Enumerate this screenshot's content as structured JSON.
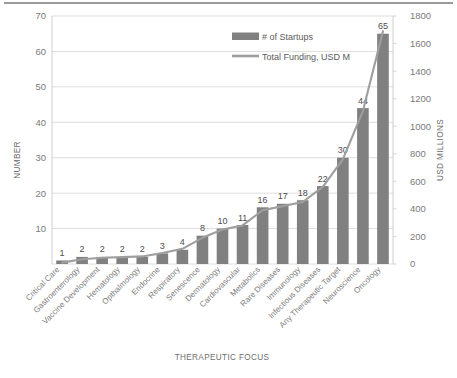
{
  "chart_data": {
    "type": "bar",
    "title": "",
    "xlabel": "THERAPEUTIC FOCUS",
    "ylabel": "NUMBER",
    "y2label": "USD MILLIONS",
    "ylim": [
      0,
      70
    ],
    "y2lim": [
      0,
      1800
    ],
    "yticks": [
      0,
      10,
      20,
      30,
      40,
      50,
      60,
      70
    ],
    "y2ticks": [
      0,
      200,
      400,
      600,
      800,
      1000,
      1200,
      1400,
      1600,
      1800
    ],
    "grid": true,
    "legend_position": "top-right",
    "categories": [
      "Critical Care",
      "Gastroenterology",
      "Vaccine Development",
      "Hematology",
      "Opthalmology",
      "Endocrine",
      "Respiratory",
      "Senescence",
      "Dermatology",
      "Cardiovascular",
      "Metabolics",
      "Rare Diseases",
      "Immunology",
      "Infectious Diseases",
      "Any Therapeutic Target",
      "Neuroscience",
      "Oncology"
    ],
    "series": [
      {
        "name": "# of Startups",
        "type": "bar",
        "axis": "left",
        "color": "#808080",
        "values": [
          1,
          2,
          2,
          2,
          2,
          3,
          4,
          8,
          10,
          11,
          16,
          17,
          18,
          22,
          30,
          44,
          65
        ],
        "data_labels": [
          "1",
          "2",
          "2",
          "2",
          "2",
          "3",
          "4",
          "8",
          "10",
          "11",
          "16",
          "17",
          "18",
          "22",
          "30",
          "44",
          "65"
        ]
      },
      {
        "name": "Total Funding, USD M",
        "type": "line",
        "axis": "right",
        "color": "#9e9e9e",
        "values": [
          10,
          35,
          45,
          50,
          55,
          80,
          110,
          190,
          250,
          280,
          390,
          420,
          450,
          560,
          760,
          1110,
          1690
        ]
      }
    ]
  },
  "legend": {
    "items": [
      {
        "label": "# of Startups",
        "marker": "bar-swatch",
        "color": "#808080"
      },
      {
        "label": "Total Funding, USD M",
        "marker": "line-swatch",
        "color": "#9e9e9e"
      }
    ]
  },
  "axes": {
    "left_title": "NUMBER",
    "right_title": "USD MILLIONS",
    "bottom_title": "THERAPEUTIC FOCUS"
  }
}
